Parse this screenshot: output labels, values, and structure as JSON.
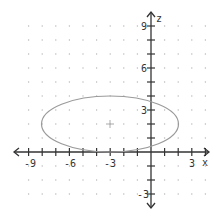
{
  "chart_data": {
    "type": "line",
    "title": "",
    "xlabel": "x",
    "ylabel": "z",
    "xlim": [
      -10,
      4
    ],
    "ylim": [
      -4,
      10
    ],
    "grid": "dots",
    "x_tick_labels": [
      "-9",
      "-6",
      "-3",
      "3"
    ],
    "y_tick_labels": [
      "9",
      "6",
      "3",
      "-3"
    ],
    "series": [
      {
        "name": "ellipse",
        "shape": "ellipse",
        "center": [
          -3,
          2
        ],
        "semi_axis_x": 5,
        "semi_axis_y": 2,
        "equation": "(x+3)^2/25 + (y-2)^2/4 = 1",
        "color": "#999999"
      }
    ],
    "center_marker": [
      -3,
      2
    ]
  },
  "labels": {
    "x_axis": "x",
    "y_axis": "z",
    "xt_m9": "-9",
    "xt_m6": "-6",
    "xt_m3": "-3",
    "xt_3": "3",
    "yt_9": "9",
    "yt_6": "6",
    "yt_3": "3",
    "yt_m3": "-3"
  }
}
